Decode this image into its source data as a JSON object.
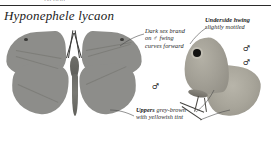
{
  "plate": {
    "bleed_fragment": "lycaon",
    "title": "Hyponephele lycaon",
    "sex_symbol": "♂"
  },
  "annotations": [
    {
      "id": "dark-sex-brand",
      "bold": "",
      "text": "Dark sex brand on ♂ fwing curves forward"
    },
    {
      "id": "underside-hwing",
      "bold": "Underside hwing",
      "text": " slightly mottled"
    },
    {
      "id": "uppers-colour",
      "bold": "Uppers",
      "text": " grey-brown with yellowish tint"
    }
  ],
  "specimens": [
    {
      "id": "upperside-male",
      "view": "upperside",
      "sex": "♂"
    },
    {
      "id": "underside-male",
      "view": "underside",
      "sex": "♂"
    }
  ],
  "colors": {
    "wing_upper": "#8d8d8a",
    "wing_under": "#a8a59a",
    "body": "#6f6f6a",
    "eyespot": "#111110",
    "rule": "#2b2b2b",
    "text": "#1b1b1b",
    "leader": "#4a4a4a",
    "page": "#ffffff"
  }
}
